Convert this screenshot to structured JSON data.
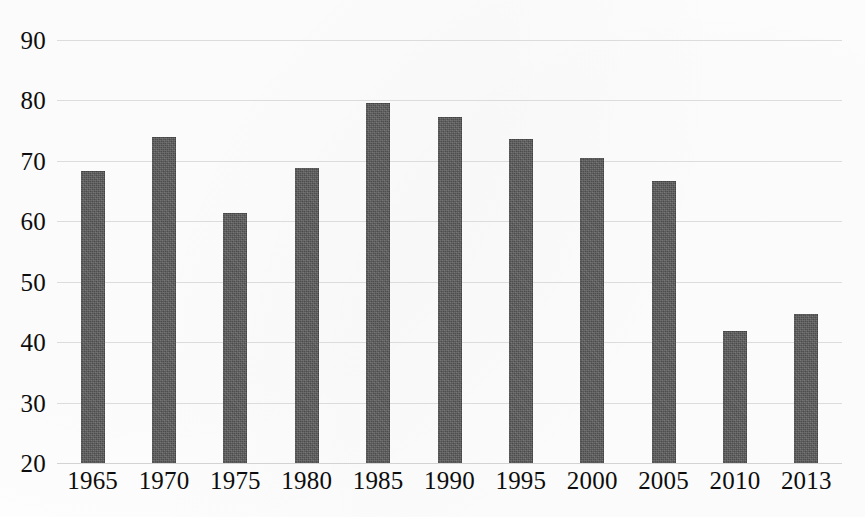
{
  "chart_data": {
    "type": "bar",
    "title": "",
    "subtitle": "",
    "xlabel": "",
    "ylabel": "",
    "categories": [
      "1965",
      "1970",
      "1975",
      "1980",
      "1985",
      "1990",
      "1995",
      "2000",
      "2005",
      "2010",
      "2013"
    ],
    "values": [
      68.4,
      73.9,
      61.4,
      68.9,
      79.5,
      77.3,
      73.7,
      70.4,
      66.7,
      41.8,
      44.7
    ],
    "series": [
      {
        "name": "",
        "values": [
          68.4,
          73.9,
          61.4,
          68.9,
          79.5,
          77.3,
          73.7,
          70.4,
          66.7,
          41.8,
          44.7
        ]
      }
    ],
    "ylim": [
      20,
      90
    ],
    "yticks": [
      20,
      30,
      40,
      50,
      60,
      70,
      80,
      90
    ],
    "ytick_labels": [
      "20",
      "30",
      "40",
      "50",
      "60",
      "70",
      "80",
      "90"
    ],
    "xtick_labels": [
      "1965",
      "1970",
      "1975",
      "1980",
      "1985",
      "1990",
      "1995",
      "2000",
      "2005",
      "2010",
      "2013"
    ],
    "grid": true,
    "grid_axis": "y",
    "legend": false,
    "legend_position": "none",
    "annotations": [],
    "colors": {
      "bar_fill": "#5c5c5c",
      "gridline": "#d9d9d9",
      "text": "#0d0d0d",
      "background": "#ffffff"
    }
  }
}
